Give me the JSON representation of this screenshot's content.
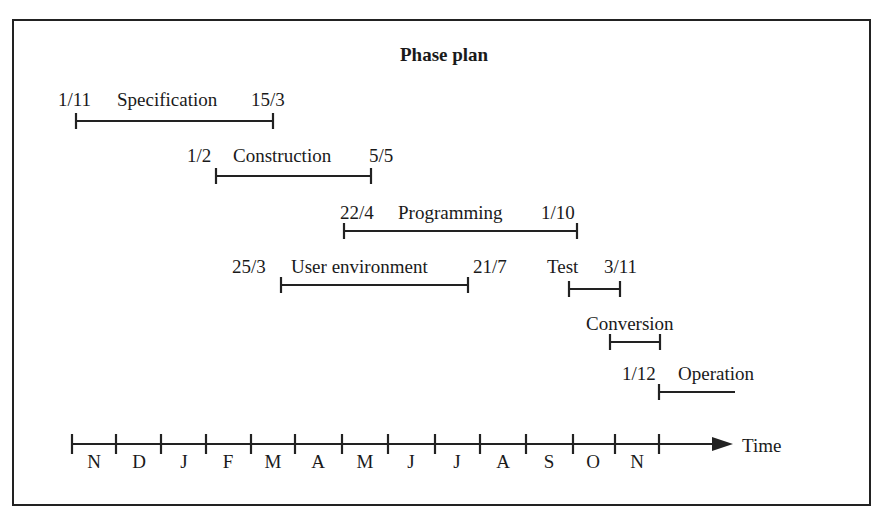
{
  "title": "Phase plan",
  "phases": [
    {
      "name": "Specification",
      "start": "1/11",
      "end": "15/3"
    },
    {
      "name": "Construction",
      "start": "1/2",
      "end": "5/5"
    },
    {
      "name": "Programming",
      "start": "22/4",
      "end": "1/10"
    },
    {
      "name": "User environment",
      "start": "25/3",
      "end": "21/7"
    },
    {
      "name": "Test",
      "start": "",
      "end": "3/11"
    },
    {
      "name": "Conversion",
      "start": "",
      "end": ""
    },
    {
      "name": "Operation",
      "start": "1/12",
      "end": ""
    }
  ],
  "axis": {
    "label": "Time",
    "months": [
      "N",
      "D",
      "J",
      "F",
      "M",
      "A",
      "M",
      "J",
      "J",
      "A",
      "S",
      "O",
      "N"
    ]
  }
}
